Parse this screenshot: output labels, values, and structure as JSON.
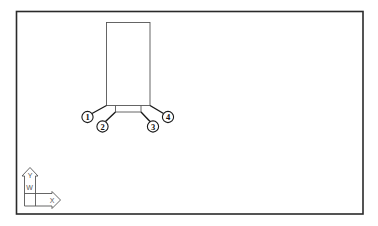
{
  "figure": {
    "callouts": [
      {
        "id": "1",
        "label": "1"
      },
      {
        "id": "2",
        "label": "2"
      },
      {
        "id": "3",
        "label": "3"
      },
      {
        "id": "4",
        "label": "4"
      }
    ],
    "ucs_icon": {
      "y_label": "Y",
      "x_label": "X",
      "w_label": "W"
    },
    "colors": {
      "frame": "#2a2a2a",
      "part_lines": "#555555",
      "leaders": "#1a1a1a",
      "background": "#ffffff"
    }
  }
}
